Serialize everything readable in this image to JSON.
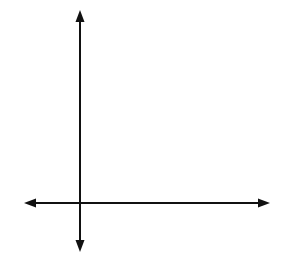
{
  "problem_number": "7.",
  "next_problem_number": "9",
  "chart_data": {
    "type": "scatter",
    "title": "",
    "xlabel": "x",
    "ylabel": "y",
    "tick_labels": {
      "x": [
        "-1"
      ],
      "y": [
        "1"
      ]
    },
    "xlim": [
      -2,
      8
    ],
    "ylim": [
      -2,
      8
    ],
    "grid": true,
    "points": [
      {
        "x": 3,
        "y": 6
      },
      {
        "x": 2,
        "y": 5
      },
      {
        "x": 4,
        "y": 5
      },
      {
        "x": 1,
        "y": 4
      },
      {
        "x": 3,
        "y": 4
      },
      {
        "x": 5,
        "y": 4
      },
      {
        "x": 2,
        "y": 3
      },
      {
        "x": 4,
        "y": 3
      },
      {
        "x": 3,
        "y": 2
      }
    ],
    "marker_color": "#000000",
    "grid_color": "#b8b8b8"
  }
}
